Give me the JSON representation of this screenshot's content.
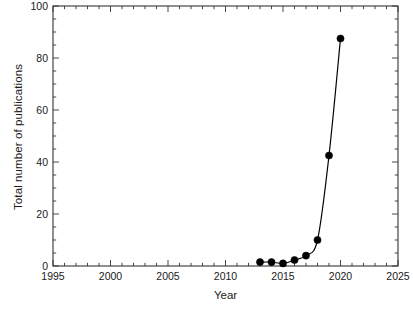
{
  "chart_data": {
    "type": "line",
    "title": "",
    "subtitle": "",
    "xlabel": "Year",
    "ylabel": "Total number of publications",
    "xlim": [
      1995,
      2025
    ],
    "ylim": [
      0,
      100
    ],
    "xticks": [
      1995,
      2000,
      2005,
      2010,
      2015,
      2020,
      2025
    ],
    "yticks": [
      0,
      20,
      40,
      60,
      80,
      100
    ],
    "xtick_labels": [
      "1995",
      "2000",
      "2005",
      "2010",
      "2015",
      "2020",
      "2025"
    ],
    "ytick_labels": [
      "0",
      "20",
      "40",
      "60",
      "80",
      "100"
    ],
    "minor_tick_interval_x": 1,
    "minor_tick_interval_y": 5,
    "grid": false,
    "legend": null,
    "annotations": [],
    "marker": "filled-circle",
    "marker_color": "#000000",
    "line_color": "#000000",
    "background_color": "#ffffff",
    "axis_color": "#333333",
    "x": [
      2013,
      2014,
      2015,
      2016,
      2017,
      2018,
      2019,
      2020
    ],
    "values": [
      1.5,
      1.5,
      1.0,
      2.3,
      4.0,
      10.0,
      42.5,
      87.5
    ],
    "series": [
      {
        "name": "Total number of publications",
        "x": [
          2013,
          2014,
          2015,
          2016,
          2017,
          2018,
          2019,
          2020
        ],
        "values": [
          1.5,
          1.5,
          1.0,
          2.3,
          4.0,
          10.0,
          42.5,
          87.5
        ]
      }
    ]
  }
}
